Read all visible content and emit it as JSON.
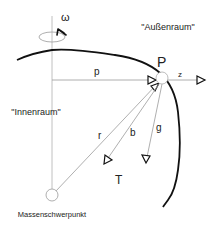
{
  "diagram": {
    "labels": {
      "omega": "ω",
      "outer_space": "\"Außenraum\"",
      "inner_space": "\"Innenraum\"",
      "point": "P",
      "p": "p",
      "z": "z",
      "r": "r",
      "b": "b",
      "g": "g",
      "T": "T",
      "center_of_mass": "Massenschwerpunkt"
    },
    "colors": {
      "thin_line": "#9a9a9a",
      "curve": "#111111",
      "text": "#222222"
    }
  }
}
